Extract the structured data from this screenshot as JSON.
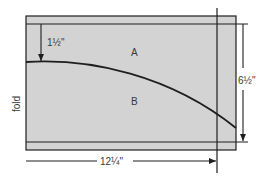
{
  "diagram": {
    "labels": {
      "region_a": "A",
      "region_b": "B",
      "fold": "fold",
      "top_offset": "1½\"",
      "height": "6½\"",
      "width": "12¼\""
    },
    "colors": {
      "panel_fill": "#d3d3d3",
      "line": "#1e1e1e",
      "background": "#ffffff"
    }
  }
}
